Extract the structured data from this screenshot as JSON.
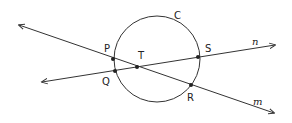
{
  "diagram": {
    "stroke_color": "#333333",
    "background": "#ffffff",
    "circle": {
      "label": "C",
      "cx": 157,
      "cy": 59,
      "r": 43
    },
    "lines": [
      {
        "name": "m",
        "label": "m",
        "from": [
          19,
          25
        ],
        "to": [
          274,
          113
        ]
      },
      {
        "name": "n",
        "label": "n",
        "from": [
          42,
          82
        ],
        "to": [
          275,
          45
        ]
      }
    ],
    "points": [
      {
        "label": "P",
        "x": 113,
        "y": 59
      },
      {
        "label": "Q",
        "x": 115,
        "y": 71
      },
      {
        "label": "T",
        "x": 137,
        "y": 67
      },
      {
        "label": "S",
        "x": 198,
        "y": 57
      },
      {
        "label": "R",
        "x": 191,
        "y": 85
      }
    ],
    "labels": {
      "C": "C",
      "P": "P",
      "Q": "Q",
      "T": "T",
      "S": "S",
      "R": "R",
      "n": "n",
      "m": "m"
    }
  }
}
